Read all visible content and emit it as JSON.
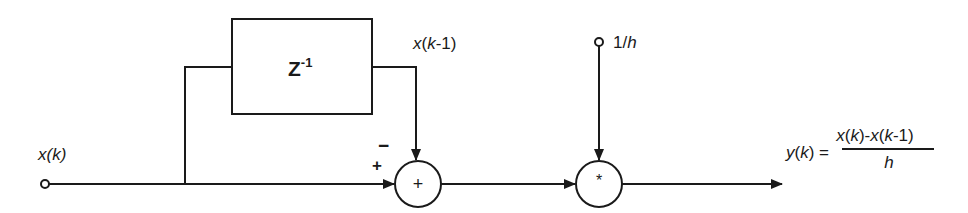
{
  "diagram": {
    "type": "block-diagram",
    "input_label": "x(k)",
    "delay_block": {
      "base": "Z",
      "exponent": "-1"
    },
    "delayed_label": "x(k-1)",
    "sum_node": {
      "symbol": "+",
      "plus_sign": "+",
      "minus_sign": "−"
    },
    "gain_input_label": "1/h",
    "multiply_node": {
      "symbol": "*"
    },
    "output_equation": {
      "lhs": "y(k) =",
      "numerator": "x(k)-x(k-1)",
      "denominator": "h"
    },
    "colors": {
      "stroke": "#1a1a1a",
      "background": "#ffffff"
    }
  }
}
